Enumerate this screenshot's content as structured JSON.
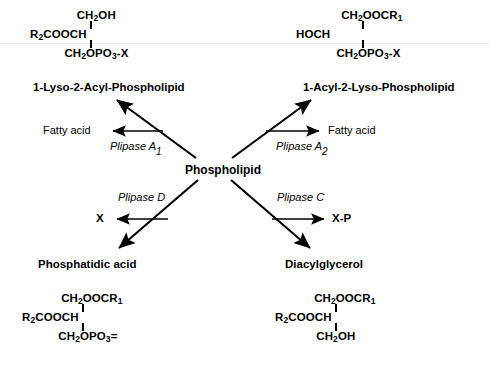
{
  "diagram": {
    "center_node": "Phospholipid",
    "products": {
      "top_left": "1-Lyso-2-Acyl-Phospholipid",
      "top_right": "1-Acyl-2-Lyso-Phospholipid",
      "bottom_left": "Phosphatidic acid",
      "bottom_right": "Diacylglycerol"
    },
    "coproducts": {
      "top_left": "Fatty acid",
      "top_right": "Fatty  acid",
      "bottom_left": "X",
      "bottom_right": "X-P"
    },
    "enzymes": {
      "a1": {
        "name": "Plipase A",
        "subscript": "1"
      },
      "a2": {
        "name": "Plipase A",
        "subscript": "2"
      },
      "d": {
        "name": "Plipase D",
        "subscript": ""
      },
      "c": {
        "name": "Plipase C",
        "subscript": ""
      }
    },
    "structures": {
      "top_left": {
        "line1_a": "CH",
        "line1_sub": "2",
        "line1_b": "OH",
        "line2_a": "R",
        "line2_sub": "2",
        "line2_b": "COOCH",
        "line3_a": "CH",
        "line3_sub1": "2",
        "line3_b": "OPO",
        "line3_sub2": "3",
        "line3_c": "-X"
      },
      "top_right": {
        "line1_a": "CH",
        "line1_sub1": "2",
        "line1_b": "OOCR",
        "line1_sub2": "1",
        "line2": "HOCH",
        "line3_a": "CH",
        "line3_sub1": "2",
        "line3_b": "OPO",
        "line3_sub2": "3",
        "line3_c": "-X"
      },
      "bottom_left": {
        "line1_a": "CH",
        "line1_sub1": "2",
        "line1_b": "OOCR",
        "line1_sub2": "1",
        "line2_a": "R",
        "line2_sub": "2",
        "line2_b": "COOCH",
        "line3_a": "CH",
        "line3_sub1": "2",
        "line3_b": "OPO",
        "line3_sub2": "3",
        "line3_c": "="
      },
      "bottom_right": {
        "line1_a": "CH",
        "line1_sub1": "2",
        "line1_b": "OOCR",
        "line1_sub2": "1",
        "line2_a": "R",
        "line2_sub": "2",
        "line2_b": "COOCH",
        "line3_a": "CH",
        "line3_sub": "2",
        "line3_b": "OH"
      }
    }
  }
}
